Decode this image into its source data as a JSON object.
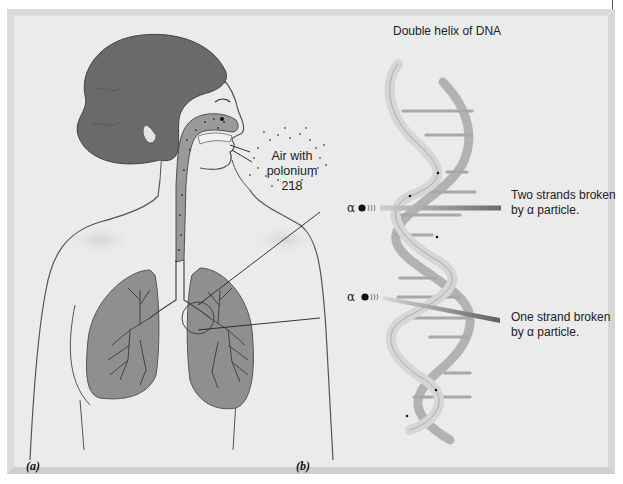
{
  "figure": {
    "panel_a": {
      "tag": "(a)",
      "callout": {
        "line1": "Air with",
        "line2": "polonium",
        "line3": "218"
      }
    },
    "panel_b": {
      "tag": "(b)",
      "title": "Double helix of DNA",
      "alpha_symbol": "α",
      "annotations": [
        {
          "line1": "Two strands broken",
          "line2": "by α particle."
        },
        {
          "line1": "One strand broken",
          "line2": "by α particle."
        }
      ]
    },
    "colors": {
      "panel_bg": "#e8e8e8",
      "hair": "#6a6a6a",
      "lung": "#8f8f8f",
      "helix_light": "#d9d9d9",
      "helix_dark": "#b4b4b4",
      "beam_dark": "#6f6f6f",
      "beam_light": "#c9c9c9"
    }
  }
}
